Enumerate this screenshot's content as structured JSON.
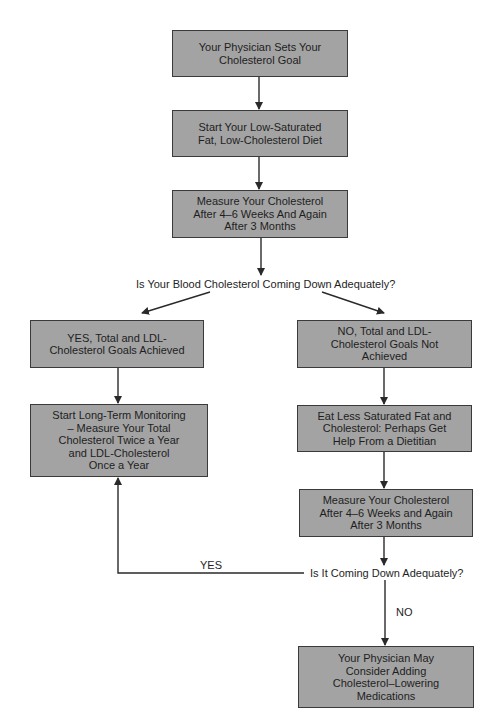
{
  "diagram": {
    "type": "flowchart",
    "colors": {
      "box_fill": "#a3a3a3",
      "box_border": "#3a3a3a",
      "line": "#2a2a2a",
      "text": "#1e1e1e"
    },
    "nodes": {
      "n1": "Your Physician Sets Your\nCholesterol Goal",
      "n2": "Start Your Low-Saturated\nFat, Low-Cholesterol Diet",
      "n3": "Measure Your Cholesterol\nAfter 4–6 Weeks And Again\nAfter 3 Months",
      "q1": "Is Your Blood Cholesterol Coming Down Adequately?",
      "yes_box": "YES, Total and LDL-\nCholesterol Goals Achieved",
      "monitor": "Start Long-Term Monitoring\n– Measure Your Total\nCholesterol Twice a Year\nand LDL-Cholesterol\nOnce a Year",
      "no_box": "NO, Total and LDL-\nCholesterol Goals Not\nAchieved",
      "eat_less": "Eat Less Saturated Fat and\nCholesterol: Perhaps Get\nHelp From a Dietitian",
      "measure2": "Measure Your Cholesterol\nAfter 4–6 Weeks and Again\nAfter 3 Months",
      "q2": "Is It Coming Down Adequately?",
      "meds": "Your Physician May\nConsider Adding\nCholesterol–Lowering\nMedications"
    },
    "edge_labels": {
      "yes": "YES",
      "no": "NO"
    }
  }
}
